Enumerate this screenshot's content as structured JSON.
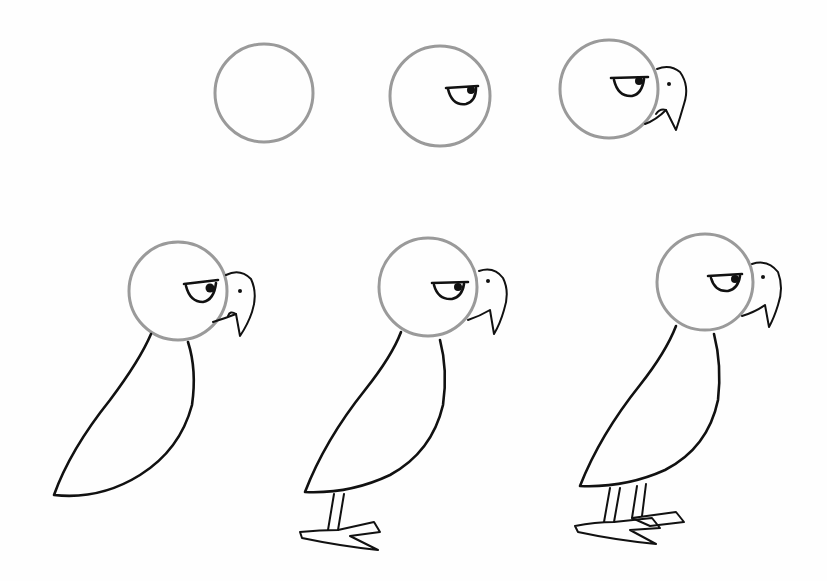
{
  "illustration": {
    "subject": "step-by-step bird drawing tutorial",
    "steps": [
      {
        "step": 1,
        "description": "circle head"
      },
      {
        "step": 2,
        "description": "head with eye"
      },
      {
        "step": 3,
        "description": "head with eye and beak"
      },
      {
        "step": 4,
        "description": "add body"
      },
      {
        "step": 5,
        "description": "add one leg and foot"
      },
      {
        "step": 6,
        "description": "add second leg and foot"
      }
    ],
    "colors": {
      "background": "#fefefe",
      "head_outline": "#9a9a9a",
      "ink": "#111111"
    }
  }
}
